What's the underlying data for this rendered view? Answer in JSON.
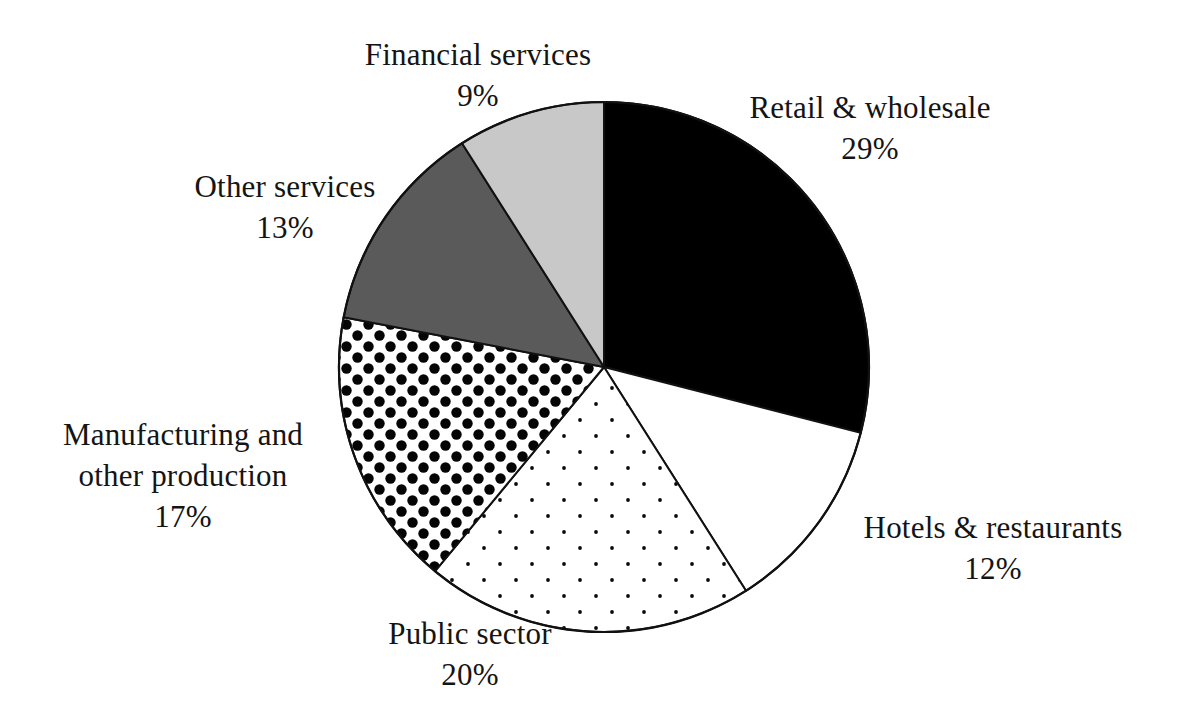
{
  "chart_data": {
    "type": "pie",
    "title": "",
    "subtitle": "",
    "xlabel": "",
    "ylabel": "",
    "unit": "%",
    "start_angle_deg": 0,
    "direction": "clockwise",
    "legend": "none (direct slice labels)",
    "grid": false,
    "total": 100,
    "categories": [
      "Retail & wholesale",
      "Hotels & restaurants",
      "Public sector",
      "Manufacturing and other production",
      "Other services",
      "Financial services"
    ],
    "values": [
      29,
      12,
      20,
      17,
      13,
      9
    ],
    "slices": [
      {
        "label": "Retail & wholesale",
        "label_lines": [
          "Retail & wholesale"
        ],
        "value": 29,
        "value_text": "29%",
        "fill": "#000000",
        "fill_style": "solid",
        "stroke": "#111111"
      },
      {
        "label": "Hotels & restaurants",
        "label_lines": [
          "Hotels & restaurants"
        ],
        "value": 12,
        "value_text": "12%",
        "fill": "#ffffff",
        "fill_style": "solid",
        "stroke": "#111111"
      },
      {
        "label": "Public sector",
        "label_lines": [
          "Public sector"
        ],
        "value": 20,
        "value_text": "20%",
        "fill": "#ffffff",
        "fill_style": "fine-dots",
        "stroke": "#111111"
      },
      {
        "label": "Manufacturing and other production",
        "label_lines": [
          "Manufacturing and",
          "other production"
        ],
        "value": 17,
        "value_text": "17%",
        "fill": "#ffffff",
        "fill_style": "large-dots",
        "stroke": "#111111"
      },
      {
        "label": "Other services",
        "label_lines": [
          "Other services"
        ],
        "value": 13,
        "value_text": "13%",
        "fill": "#5a5a5a",
        "fill_style": "solid",
        "stroke": "#111111"
      },
      {
        "label": "Financial services",
        "label_lines": [
          "Financial services"
        ],
        "value": 9,
        "value_text": "9%",
        "fill": "#c8c8c8",
        "fill_style": "solid",
        "stroke": "#111111"
      }
    ]
  },
  "labels": {
    "financial_services": {
      "name": "Financial services",
      "value": "9%"
    },
    "retail_wholesale": {
      "name": "Retail & wholesale",
      "value": "29%"
    },
    "hotels_restaurants": {
      "name": "Hotels & restaurants",
      "value": "12%"
    },
    "public_sector": {
      "name": "Public sector",
      "value": "20%"
    },
    "manufacturing": {
      "name_line1": "Manufacturing and",
      "name_line2": "other production",
      "value": "17%"
    },
    "other_services": {
      "name": "Other services",
      "value": "13%"
    }
  },
  "colors": {
    "background": "#ffffff",
    "ink": "#141414",
    "slice_black": "#000000",
    "slice_dark_gray": "#5a5a5a",
    "slice_light_gray": "#c8c8c8",
    "slice_white": "#ffffff",
    "outline": "#111111"
  }
}
